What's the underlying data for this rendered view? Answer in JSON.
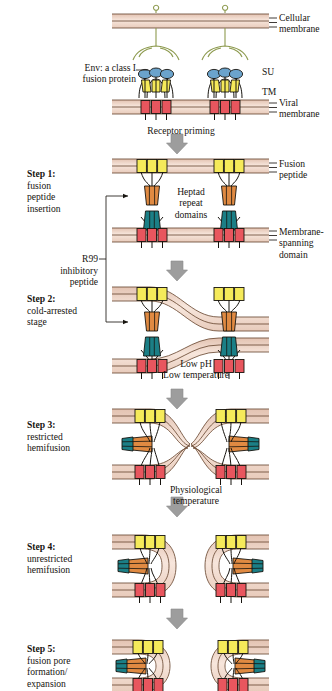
{
  "figure": {
    "type": "biological-process-diagram"
  },
  "labels": {
    "cellular_membrane": "Cellular\nmembrane",
    "viral_membrane": "Viral\nmembrane",
    "env": "Env: a class I\nfusion protein",
    "su": "SU",
    "tm": "TM",
    "fusion_peptide": "Fusion\npeptide",
    "heptad": "Heptad\nrepeat\ndomains",
    "membrane_spanning": "Membrane-\nspanning\ndomain",
    "r99": "R99",
    "r99_rest": "inhibitory\npeptide"
  },
  "transitions": [
    {
      "id": "receptor-priming",
      "text": "Receptor priming"
    },
    {
      "id": "low-ph-temp",
      "text": "Low pH\nLow temperature"
    },
    {
      "id": "physiological-temp",
      "text": "Physiological\ntemperature"
    }
  ],
  "steps": [
    {
      "id": 1,
      "name": "Step 1:",
      "desc": "fusion\npeptide\ninsertion"
    },
    {
      "id": 2,
      "name": "Step 2:",
      "desc": "cold-arrested\nstage"
    },
    {
      "id": 3,
      "name": "Step 3:",
      "desc": "restricted\nhemifusion"
    },
    {
      "id": 4,
      "name": "Step 4:",
      "desc": "unrestricted\nhemifusion"
    },
    {
      "id": 5,
      "name": "Step 5:",
      "desc": "fusion pore\nformation/\nexpansion"
    }
  ],
  "colors": {
    "membrane_fill": "#eccfc0",
    "membrane_inner": "#f6e3d8",
    "membrane_line": "#6b4a34",
    "su_blue": "#6ba3cc",
    "tm_yellow": "#f5ea5a",
    "red_domain": "#e8565e",
    "orange_hr": "#e08a42",
    "teal_hr": "#1b7f86",
    "receptor_green": "#cdd98a",
    "arrow_gray": "#9a9a9a",
    "stroke": "#17140f"
  }
}
